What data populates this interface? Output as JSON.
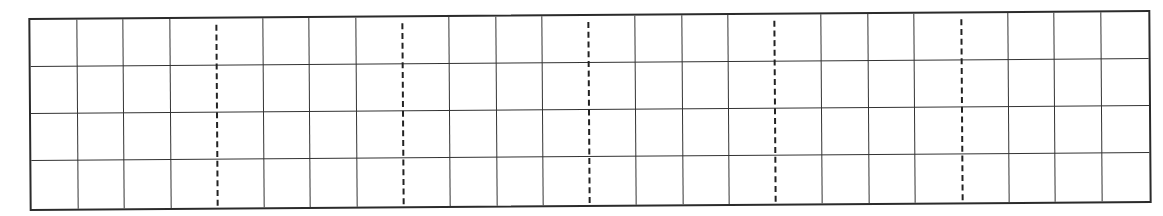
{
  "worksheet": {
    "type": "writing-grid",
    "columns": 24,
    "rows": 4,
    "dashed_every_n_columns": 4,
    "colors": {
      "border": "#2b2b2b",
      "line": "#333333",
      "dashed": "#222222",
      "background": "#ffffff"
    }
  }
}
